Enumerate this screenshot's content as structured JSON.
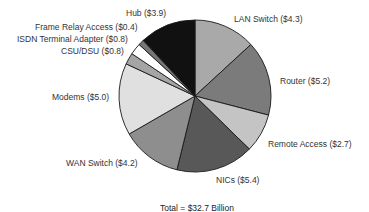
{
  "chart_data": {
    "type": "pie",
    "title": "",
    "start_angle_deg": 0,
    "direction": "clockwise",
    "slices": [
      {
        "label": "LAN Switch",
        "value": 4.3,
        "display": "LAN Switch ($4.3)",
        "color": "#a9a9a9"
      },
      {
        "label": "Router",
        "value": 5.2,
        "display": "Router ($5.2)",
        "color": "#7b7b7b"
      },
      {
        "label": "Remote Access",
        "value": 2.7,
        "display": "Remote Access ($2.7)",
        "color": "#c4c4c4"
      },
      {
        "label": "NICs",
        "value": 5.4,
        "display": "NICs ($5.4)",
        "color": "#585858"
      },
      {
        "label": "WAN Switch",
        "value": 4.2,
        "display": "WAN Switch ($4.2)",
        "color": "#8e8e8e"
      },
      {
        "label": "Modems",
        "value": 5.0,
        "display": "Modems ($5.0)",
        "color": "#e0e0e0"
      },
      {
        "label": "CSU/DSU",
        "value": 0.8,
        "display": "CSU/DSU ($0.8)",
        "color": "#a5a5a5"
      },
      {
        "label": "ISDN Terminal Adapter",
        "value": 0.8,
        "display": "ISDN Terminal Adapter ($0.8)",
        "color": "#ffffff"
      },
      {
        "label": "Frame Relay Access",
        "value": 0.4,
        "display": "Frame Relay Access ($0.4)",
        "color": "#767676"
      },
      {
        "label": "Hub",
        "value": 3.9,
        "display": "Hub ($3.9)",
        "color": "#111111"
      }
    ],
    "total_label": "Total = $32.7 Billion",
    "units": "$ Billion"
  },
  "labels": {
    "lan_switch": "LAN Switch ($4.3)",
    "router": "Router ($5.2)",
    "remote_access": "Remote Access ($2.7)",
    "nics": "NICs ($5.4)",
    "wan_switch": "WAN Switch ($4.2)",
    "modems": "Modems ($5.0)",
    "csu_dsu": "CSU/DSU ($0.8)",
    "isdn": "ISDN Terminal Adapter ($0.8)",
    "frame_relay": "Frame Relay Access ($0.4)",
    "hub": "Hub ($3.9)",
    "total": "Total = $32.7 Billion"
  }
}
